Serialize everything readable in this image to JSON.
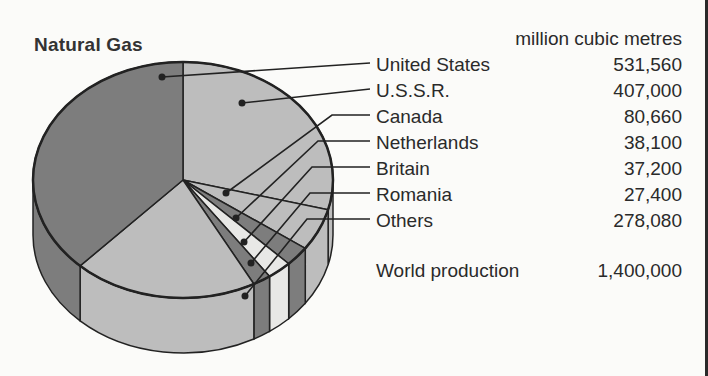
{
  "title": "Natural Gas",
  "unit_label": "million cubic metres",
  "legend": [
    {
      "label": "United States",
      "value": "531,560"
    },
    {
      "label": "U.S.S.R.",
      "value": "407,000"
    },
    {
      "label": "Canada",
      "value": "80,660"
    },
    {
      "label": "Netherlands",
      "value": "38,100"
    },
    {
      "label": "Britain",
      "value": "37,200"
    },
    {
      "label": "Romania",
      "value": "27,400"
    },
    {
      "label": "Others",
      "value": "278,080"
    }
  ],
  "total": {
    "label": "World production",
    "value": "1,400,000"
  },
  "colors": {
    "dark": "#7d7d7d",
    "light": "#bdbdbd",
    "lighter": "#d6d6d6",
    "palest": "#e8e8e6",
    "outline": "#222222"
  },
  "chart_data": {
    "type": "pie",
    "title": "Natural Gas",
    "unit": "million cubic metres",
    "categories": [
      "United States",
      "U.S.S.R.",
      "Canada",
      "Netherlands",
      "Britain",
      "Romania",
      "Others"
    ],
    "values": [
      531560,
      407000,
      80660,
      38100,
      37200,
      27400,
      278080
    ],
    "total": 1400000,
    "total_label": "World production",
    "style": "3d-tilted pie with leader lines to legend"
  }
}
